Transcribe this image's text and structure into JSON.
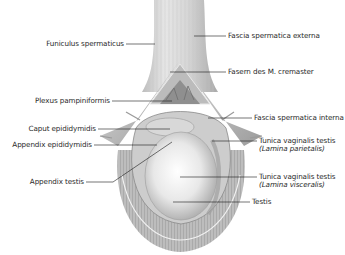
{
  "diagram": {
    "type": "anatomical-illustration",
    "colors": {
      "background": "#ffffff",
      "tissue_light": "#e9e9e9",
      "tissue_mid": "#b9b9b9",
      "tissue_dark": "#7a7a7a",
      "leader_line": "#1a1a1a",
      "label_text": "#2a2a2a"
    },
    "labels_left": [
      {
        "id": "funiculus",
        "text": "Funiculus spermaticus"
      },
      {
        "id": "plexus",
        "text": "Plexus pampiniformis"
      },
      {
        "id": "caput",
        "text": "Caput epididymidis"
      },
      {
        "id": "app-epi",
        "text": "Appendix epididymidis"
      },
      {
        "id": "app-testis",
        "text": "Appendix testis"
      }
    ],
    "labels_right": [
      {
        "id": "fascia-ext",
        "text": "Fascia spermatica externa"
      },
      {
        "id": "cremaster",
        "text": "Fasern des M. cremaster"
      },
      {
        "id": "fascia-int",
        "text": "Fascia spermatica interna"
      },
      {
        "id": "tv-parietal",
        "text": "Tunica vaginalis testis",
        "sub": "(Lamina parietalis)"
      },
      {
        "id": "tv-visceral",
        "text": "Tunica vaginalis testis",
        "sub": "(Lamina visceralis)"
      },
      {
        "id": "testis",
        "text": "Testis"
      }
    ]
  }
}
